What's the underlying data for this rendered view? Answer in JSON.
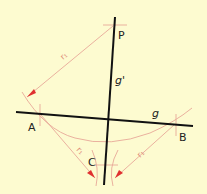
{
  "diagram": {
    "colors": {
      "background": "#fdfbd0",
      "main_line": "#111111",
      "construction": "#e8a898",
      "arrow": "#e03030"
    },
    "labels": {
      "P": "P",
      "A": "A",
      "B": "B",
      "C": "C",
      "g": "g",
      "g_prime": "g'",
      "r1_top": "r₁",
      "r1_left": "r₁",
      "r1_right": "r₁"
    }
  }
}
